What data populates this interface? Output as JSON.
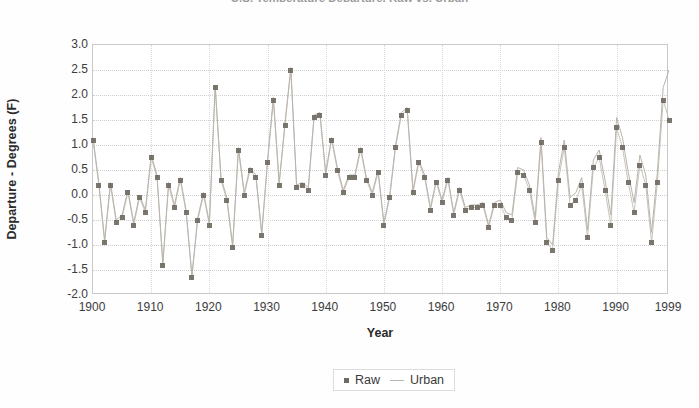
{
  "chart_data": {
    "type": "scatter",
    "title": "U.S. Temperature Departure, Raw vs. Urban",
    "xlabel": "Year",
    "ylabel": "Departure - Degrees (F)",
    "xlim": [
      1900,
      1999
    ],
    "ylim": [
      -2.0,
      3.0
    ],
    "ytick_labels": [
      "3.0",
      "2.5",
      "2.0",
      "1.5",
      "1.0",
      "0.5",
      "0.0",
      "-0.5",
      "-1.0",
      "-1.5",
      "-2.0"
    ],
    "ytick_values": [
      3.0,
      2.5,
      2.0,
      1.5,
      1.0,
      0.5,
      0.0,
      -0.5,
      -1.0,
      -1.5,
      -2.0
    ],
    "xtick_labels": [
      "1900",
      "1910",
      "1920",
      "1930",
      "1940",
      "1950",
      "1960",
      "1970",
      "1980",
      "1990",
      "1999"
    ],
    "xtick_values": [
      1900,
      1910,
      1920,
      1930,
      1940,
      1950,
      1960,
      1970,
      1980,
      1990,
      1999
    ],
    "grid": true,
    "legend_position": "bottom-center",
    "colors": {
      "raw": "#6d685f",
      "urban": "#b9b5ad",
      "grid": "#cfcfcf",
      "frame": "#c9c9c9"
    },
    "x": [
      1900,
      1901,
      1902,
      1903,
      1904,
      1905,
      1906,
      1907,
      1908,
      1909,
      1910,
      1911,
      1912,
      1913,
      1914,
      1915,
      1916,
      1917,
      1918,
      1919,
      1920,
      1921,
      1922,
      1923,
      1924,
      1925,
      1926,
      1927,
      1928,
      1929,
      1930,
      1931,
      1932,
      1933,
      1934,
      1935,
      1936,
      1937,
      1938,
      1939,
      1940,
      1941,
      1942,
      1943,
      1944,
      1945,
      1946,
      1947,
      1948,
      1949,
      1950,
      1951,
      1952,
      1953,
      1954,
      1955,
      1956,
      1957,
      1958,
      1959,
      1960,
      1961,
      1962,
      1963,
      1964,
      1965,
      1966,
      1967,
      1968,
      1969,
      1970,
      1971,
      1972,
      1973,
      1974,
      1975,
      1976,
      1977,
      1978,
      1979,
      1980,
      1981,
      1982,
      1983,
      1984,
      1985,
      1986,
      1987,
      1988,
      1989,
      1990,
      1991,
      1992,
      1993,
      1994,
      1995,
      1996,
      1997,
      1998,
      1999
    ],
    "series": [
      {
        "name": "Raw",
        "marker": "square",
        "values": [
          1.1,
          0.2,
          -0.95,
          0.2,
          -0.55,
          -0.45,
          0.05,
          -0.6,
          -0.05,
          -0.35,
          0.75,
          0.35,
          -1.4,
          0.2,
          -0.25,
          0.3,
          -0.35,
          -1.65,
          -0.5,
          0.0,
          -0.6,
          2.15,
          0.3,
          -0.1,
          -1.05,
          0.9,
          0.0,
          0.5,
          0.35,
          -0.8,
          0.65,
          1.9,
          0.2,
          1.4,
          2.5,
          0.15,
          0.2,
          0.1,
          1.55,
          1.6,
          0.4,
          1.1,
          0.5,
          0.05,
          0.35,
          0.35,
          0.9,
          0.3,
          0.0,
          0.45,
          -0.6,
          -0.05,
          0.95,
          1.6,
          1.7,
          0.05,
          0.65,
          0.35,
          -0.3,
          0.25,
          -0.15,
          0.3,
          -0.4,
          0.1,
          -0.3,
          -0.25,
          -0.25,
          -0.2,
          -0.65,
          -0.2,
          -0.2,
          -0.45,
          -0.5,
          0.45,
          0.4,
          0.1,
          -0.55,
          1.05,
          -0.95,
          -1.1,
          0.3,
          0.95,
          -0.2,
          -0.1,
          0.2,
          -0.85,
          0.55,
          0.75,
          0.1,
          -0.6,
          1.35,
          0.95,
          0.25,
          -0.35,
          0.6,
          0.2,
          -0.95,
          0.25,
          1.9,
          1.5
        ]
      },
      {
        "name": "Urban",
        "marker": "line",
        "values": [
          1.15,
          0.25,
          -0.9,
          0.25,
          -0.5,
          -0.4,
          0.1,
          -0.55,
          0.0,
          -0.3,
          0.8,
          0.4,
          -1.35,
          0.25,
          -0.2,
          0.35,
          -0.3,
          -1.6,
          -0.45,
          0.05,
          -0.55,
          2.2,
          0.35,
          -0.05,
          -1.0,
          0.95,
          0.05,
          0.55,
          0.4,
          -0.75,
          0.7,
          1.95,
          0.25,
          1.45,
          2.55,
          0.2,
          0.25,
          0.15,
          1.6,
          1.65,
          0.45,
          1.15,
          0.55,
          0.1,
          0.4,
          0.4,
          0.95,
          0.35,
          0.05,
          0.5,
          -0.55,
          0.0,
          1.0,
          1.65,
          1.75,
          0.1,
          0.7,
          0.4,
          -0.25,
          0.3,
          -0.1,
          0.35,
          -0.35,
          0.15,
          -0.25,
          -0.2,
          -0.2,
          -0.15,
          -0.6,
          -0.15,
          -0.1,
          -0.35,
          -0.4,
          0.55,
          0.5,
          0.2,
          -0.45,
          1.15,
          -0.85,
          -1.0,
          0.45,
          1.1,
          -0.05,
          0.05,
          0.35,
          -0.7,
          0.7,
          0.9,
          0.3,
          -0.4,
          1.55,
          1.15,
          0.45,
          -0.15,
          0.8,
          0.4,
          -0.75,
          0.45,
          2.15,
          2.5
        ]
      }
    ]
  },
  "legend": {
    "raw_label": "Raw",
    "urban_label": "Urban"
  }
}
